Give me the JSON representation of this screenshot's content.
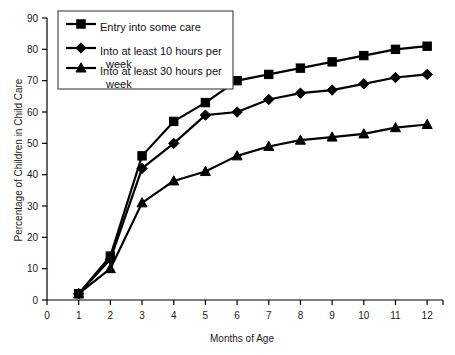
{
  "chart_data": {
    "type": "line",
    "title": "",
    "xlabel": "Months of Age",
    "ylabel": "Percentage of Children in Child Care",
    "x": [
      1,
      2,
      3,
      4,
      5,
      6,
      7,
      8,
      9,
      10,
      11,
      12
    ],
    "xlim": [
      0,
      12.5
    ],
    "ylim": [
      0,
      90
    ],
    "xticks": [
      0,
      1,
      2,
      3,
      4,
      5,
      6,
      7,
      8,
      9,
      10,
      11,
      12
    ],
    "yticks": [
      0,
      10,
      20,
      30,
      40,
      50,
      60,
      70,
      80,
      90
    ],
    "grid": false,
    "legend_position": "top-left",
    "series": [
      {
        "name": "Entry into some care",
        "marker": "square",
        "values": [
          2,
          14,
          46,
          57,
          63,
          70,
          72,
          74,
          76,
          78,
          80,
          81
        ]
      },
      {
        "name": "Into at least 10 hours per week",
        "marker": "diamond",
        "values": [
          2,
          13,
          42,
          50,
          59,
          60,
          64,
          66,
          67,
          69,
          71,
          72
        ]
      },
      {
        "name": "Into at least 30 hours per week",
        "marker": "triangle",
        "values": [
          2,
          10,
          31,
          38,
          41,
          46,
          49,
          51,
          52,
          53,
          55,
          56
        ]
      }
    ]
  },
  "legend": {
    "entries": [
      {
        "label": "Entry into some care",
        "label_line2": ""
      },
      {
        "label": "Into at least 10 hours per",
        "label_line2": "week"
      },
      {
        "label": "Into at least 30 hours per",
        "label_line2": "week"
      }
    ]
  },
  "colors": {
    "line": "#000000",
    "axis": "#000000",
    "text": "#1a1a1a",
    "legend_border": "#4d4d4d",
    "background": "#ffffff"
  }
}
